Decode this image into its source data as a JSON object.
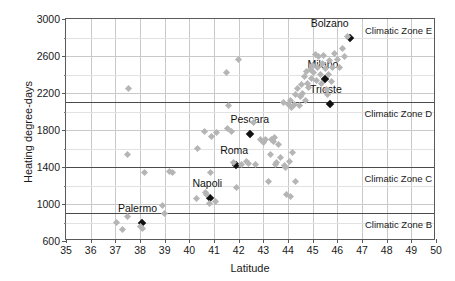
{
  "chart_data": {
    "type": "scatter",
    "title": "",
    "xlabel": "Latitude",
    "ylabel": "Heating degree-days",
    "xlim": [
      35,
      50
    ],
    "ylim": [
      600,
      3000
    ],
    "xticks": [
      35,
      36,
      37,
      38,
      39,
      40,
      41,
      42,
      43,
      44,
      45,
      46,
      47,
      48,
      49,
      50
    ],
    "yticks": [
      600,
      1000,
      1400,
      1800,
      2200,
      2600,
      3000
    ],
    "yticks_minor": [
      800,
      1200,
      1600,
      2000,
      2400,
      2800
    ],
    "grid": true,
    "legend": "none",
    "zone_lines": [
      {
        "label": "Climatic Zone E",
        "y": 3000,
        "label_y": 2940
      },
      {
        "label": "Climatic Zone D",
        "y": 2100,
        "label_y": 2040
      },
      {
        "label": "Climatic Zone C",
        "y": 1400,
        "label_y": 1340
      },
      {
        "label": "Climatic Zone B",
        "y": 900,
        "label_y": 840
      }
    ],
    "series": [
      {
        "name": "Labelled provincial capitals",
        "color": "#111111",
        "marker": "diamond",
        "points": [
          {
            "label": "Bolzano",
            "x": 46.5,
            "y": 2790,
            "label_dx": -20,
            "label_dy": -9
          },
          {
            "label": "Milano",
            "x": 45.5,
            "y": 2350,
            "label_dx": -2,
            "label_dy": -9
          },
          {
            "label": "Trieste",
            "x": 45.7,
            "y": 2080,
            "label_dx": -4,
            "label_dy": -9
          },
          {
            "label": "Pescara",
            "x": 42.45,
            "y": 1760,
            "label_dx": 0,
            "label_dy": -9
          },
          {
            "label": "Roma",
            "x": 41.9,
            "y": 1420,
            "label_dx": -2,
            "label_dy": -9
          },
          {
            "label": "Napoli",
            "x": 40.85,
            "y": 1070,
            "label_dx": -3,
            "label_dy": -9
          },
          {
            "label": "Palermo",
            "x": 38.1,
            "y": 800,
            "label_dx": -5,
            "label_dy": -9
          }
        ]
      },
      {
        "name": "Other provincial capitals",
        "color": "#b5b5b5",
        "marker": "diamond",
        "points": [
          {
            "x": 37.05,
            "y": 800
          },
          {
            "x": 37.3,
            "y": 720
          },
          {
            "x": 37.5,
            "y": 860
          },
          {
            "x": 37.5,
            "y": 1540
          },
          {
            "x": 37.55,
            "y": 2250
          },
          {
            "x": 38.0,
            "y": 760
          },
          {
            "x": 38.1,
            "y": 740
          },
          {
            "x": 38.2,
            "y": 1340
          },
          {
            "x": 38.9,
            "y": 980
          },
          {
            "x": 39.0,
            "y": 900
          },
          {
            "x": 39.2,
            "y": 1350
          },
          {
            "x": 39.3,
            "y": 1340
          },
          {
            "x": 40.3,
            "y": 1060
          },
          {
            "x": 40.35,
            "y": 1600
          },
          {
            "x": 40.6,
            "y": 1780
          },
          {
            "x": 40.65,
            "y": 1120
          },
          {
            "x": 40.7,
            "y": 1100
          },
          {
            "x": 40.8,
            "y": 1010
          },
          {
            "x": 40.85,
            "y": 1340
          },
          {
            "x": 40.9,
            "y": 1730
          },
          {
            "x": 41.05,
            "y": 1030
          },
          {
            "x": 41.1,
            "y": 1770
          },
          {
            "x": 41.5,
            "y": 2420
          },
          {
            "x": 41.55,
            "y": 1820
          },
          {
            "x": 41.6,
            "y": 2060
          },
          {
            "x": 41.9,
            "y": 1180
          },
          {
            "x": 42.0,
            "y": 2560
          },
          {
            "x": 42.1,
            "y": 1430
          },
          {
            "x": 42.6,
            "y": 1880
          },
          {
            "x": 42.7,
            "y": 1430
          },
          {
            "x": 42.9,
            "y": 1700
          },
          {
            "x": 43.0,
            "y": 1660
          },
          {
            "x": 43.1,
            "y": 1700
          },
          {
            "x": 43.2,
            "y": 1240
          },
          {
            "x": 43.3,
            "y": 1530
          },
          {
            "x": 43.35,
            "y": 1700
          },
          {
            "x": 43.4,
            "y": 1680
          },
          {
            "x": 43.45,
            "y": 1720
          },
          {
            "x": 43.5,
            "y": 1430
          },
          {
            "x": 43.55,
            "y": 1450
          },
          {
            "x": 43.6,
            "y": 1640
          },
          {
            "x": 43.7,
            "y": 1500
          },
          {
            "x": 43.8,
            "y": 2100
          },
          {
            "x": 43.85,
            "y": 1420
          },
          {
            "x": 43.9,
            "y": 1390
          },
          {
            "x": 43.95,
            "y": 1100
          },
          {
            "x": 44.0,
            "y": 2080
          },
          {
            "x": 44.05,
            "y": 1460
          },
          {
            "x": 44.1,
            "y": 2120
          },
          {
            "x": 44.15,
            "y": 2040
          },
          {
            "x": 44.2,
            "y": 1560
          },
          {
            "x": 44.25,
            "y": 2080
          },
          {
            "x": 44.3,
            "y": 2180
          },
          {
            "x": 44.4,
            "y": 2250
          },
          {
            "x": 44.45,
            "y": 2060
          },
          {
            "x": 44.5,
            "y": 2160
          },
          {
            "x": 44.55,
            "y": 2290
          },
          {
            "x": 44.6,
            "y": 2200
          },
          {
            "x": 44.65,
            "y": 2380
          },
          {
            "x": 44.7,
            "y": 2120
          },
          {
            "x": 44.75,
            "y": 2430
          },
          {
            "x": 44.8,
            "y": 2300
          },
          {
            "x": 44.85,
            "y": 2260
          },
          {
            "x": 44.9,
            "y": 2450
          },
          {
            "x": 44.95,
            "y": 2360
          },
          {
            "x": 45.0,
            "y": 2500
          },
          {
            "x": 45.05,
            "y": 2420
          },
          {
            "x": 45.1,
            "y": 2620
          },
          {
            "x": 45.15,
            "y": 2330
          },
          {
            "x": 45.2,
            "y": 2480
          },
          {
            "x": 45.25,
            "y": 2590
          },
          {
            "x": 45.3,
            "y": 2400
          },
          {
            "x": 45.35,
            "y": 2300
          },
          {
            "x": 45.4,
            "y": 2520
          },
          {
            "x": 45.45,
            "y": 2610
          },
          {
            "x": 45.5,
            "y": 2470
          },
          {
            "x": 45.55,
            "y": 2240
          },
          {
            "x": 45.6,
            "y": 2180
          },
          {
            "x": 45.65,
            "y": 2400
          },
          {
            "x": 45.7,
            "y": 2550
          },
          {
            "x": 45.75,
            "y": 2320
          },
          {
            "x": 45.8,
            "y": 2480
          },
          {
            "x": 45.9,
            "y": 2630
          },
          {
            "x": 46.0,
            "y": 2560
          },
          {
            "x": 46.1,
            "y": 2480
          },
          {
            "x": 46.2,
            "y": 2680
          },
          {
            "x": 46.3,
            "y": 2600
          },
          {
            "x": 46.4,
            "y": 2810
          },
          {
            "x": 44.3,
            "y": 1240
          },
          {
            "x": 44.1,
            "y": 1080
          },
          {
            "x": 42.3,
            "y": 1460
          },
          {
            "x": 42.4,
            "y": 1440
          },
          {
            "x": 41.7,
            "y": 1780
          },
          {
            "x": 41.8,
            "y": 1450
          }
        ]
      }
    ]
  }
}
